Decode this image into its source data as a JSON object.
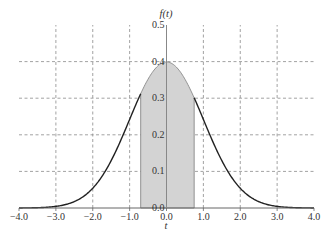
{
  "chart_data": {
    "type": "area",
    "title": "",
    "xlabel": "t",
    "ylabel": "f(t)",
    "xlim": [
      -4.0,
      4.0
    ],
    "ylim": [
      0.0,
      0.5
    ],
    "x_ticks": [
      -4.0,
      -3.0,
      -2.0,
      -1.0,
      0.0,
      1.0,
      2.0,
      3.0,
      4.0
    ],
    "x_tick_labels": [
      "-4.0",
      "-3.0",
      "-2.0",
      "-1.0",
      "0.0",
      "1.0",
      "2.0",
      "3.0",
      "4.0"
    ],
    "y_ticks": [
      0.0,
      0.1,
      0.2,
      0.3,
      0.4,
      0.5
    ],
    "y_tick_labels": [
      "0.0",
      "0.1",
      "0.2",
      "0.3",
      "0.4",
      "0.5"
    ],
    "grid": true,
    "grid_style": "dashed",
    "legend": null,
    "series": [
      {
        "name": "f(t) standard normal density",
        "function": "exp(-t^2/2)/sqrt(2*pi)",
        "x": [
          -4.0,
          -3.5,
          -3.0,
          -2.5,
          -2.0,
          -1.5,
          -1.0,
          -0.5,
          0.0,
          0.5,
          1.0,
          1.5,
          2.0,
          2.5,
          3.0,
          3.5,
          4.0
        ],
        "values": [
          0.0001,
          0.0009,
          0.0044,
          0.0175,
          0.054,
          0.1295,
          0.242,
          0.3521,
          0.3989,
          0.3521,
          0.242,
          0.1295,
          0.054,
          0.0175,
          0.0044,
          0.0009,
          0.0001
        ],
        "color": "#222222"
      }
    ],
    "shaded_region": {
      "x_from": -0.7,
      "x_to": 0.75,
      "fill": "#d3d3d3",
      "edge": "#888888"
    }
  },
  "labels": {
    "x_axis_title": "t",
    "y_axis_title": "f(t)"
  }
}
